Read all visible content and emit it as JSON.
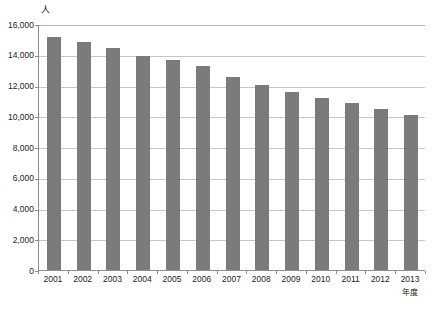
{
  "chart_data": {
    "type": "bar",
    "title": "",
    "subtitle": "",
    "xlabel": "年度",
    "ylabel": "人",
    "categories": [
      "2001",
      "2002",
      "2003",
      "2004",
      "2005",
      "2006",
      "2007",
      "2008",
      "2009",
      "2010",
      "2011",
      "2012",
      "2013"
    ],
    "values": [
      15150,
      14850,
      14450,
      13900,
      13650,
      13250,
      12550,
      12050,
      11600,
      11200,
      10850,
      10450,
      10100
    ],
    "series": [
      {
        "name": "",
        "values": [
          15150,
          14850,
          14450,
          13900,
          13650,
          13250,
          12550,
          12050,
          11600,
          11200,
          10850,
          10450,
          10100
        ]
      }
    ],
    "ylim": [
      0,
      16000
    ],
    "ytick_values": [
      0,
      2000,
      4000,
      6000,
      8000,
      10000,
      12000,
      14000,
      16000
    ],
    "ytick_labels": [
      "0",
      "2,000",
      "4,000",
      "6,000",
      "8,000",
      "10,000",
      "12,000",
      "14,000",
      "16,000"
    ],
    "grid": true,
    "grid_axis": "y",
    "legend": false,
    "legend_position": "none",
    "annotations": [],
    "colors": {
      "bar": "#7b7b7b",
      "gridline": "#c8c8c8",
      "axis": "#8d8d8d",
      "text": "#222222",
      "background": "#ffffff"
    }
  }
}
